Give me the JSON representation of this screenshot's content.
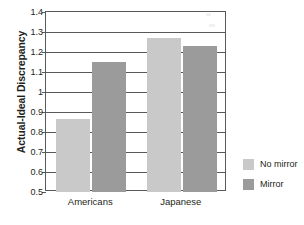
{
  "chart_data": {
    "type": "bar",
    "title": "",
    "xlabel": "",
    "ylabel": "Actual-Ideal Discrepancy",
    "categories": [
      "Americans",
      "Japanese"
    ],
    "series": [
      {
        "name": "No mirror",
        "values": [
          0.865,
          1.27
        ],
        "color": "#c9c9c9"
      },
      {
        "name": "Mirror",
        "values": [
          1.148,
          1.23
        ],
        "color": "#9b9b9b"
      }
    ],
    "ylim": [
      0.5,
      1.4
    ],
    "ytick_step": 0.1,
    "ytick_labels": [
      "1.4",
      "1.3",
      "1.2",
      "1.1",
      "1",
      "0.9",
      "0.8",
      "0.7",
      "0.6",
      "0.5"
    ],
    "ytick_values": [
      1.4,
      1.3,
      1.2,
      1.1,
      1.0,
      0.9,
      0.8,
      0.7,
      0.6,
      0.5
    ],
    "grid": true,
    "grid_orientation": "horizontal",
    "legend_position": "right",
    "legend_entries": [
      "No mirror",
      "Mirror"
    ],
    "axis_color": "#58595b",
    "text_color": "#231f20",
    "background": "#ffffff"
  },
  "legend": {
    "entries": [
      {
        "label": "No mirror",
        "swatch_name": "legend-swatch-no-mirror"
      },
      {
        "label": "Mirror",
        "swatch_name": "legend-swatch-mirror"
      }
    ]
  },
  "axes": {
    "y_title": "Actual-Ideal Discrepancy",
    "x_categories": [
      "Americans",
      "Japanese"
    ]
  }
}
